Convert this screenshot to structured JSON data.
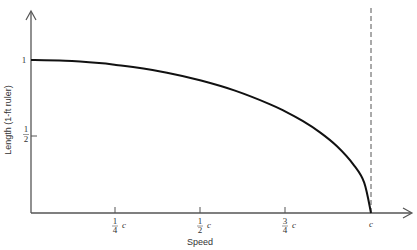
{
  "chart_data": {
    "type": "line",
    "title": "",
    "xlabel": "Speed",
    "ylabel": "Length (1-ft ruler)",
    "x_ticks": [
      {
        "num": "1",
        "den": "4",
        "unit": "c",
        "value": 0.25
      },
      {
        "num": "1",
        "den": "2",
        "unit": "c",
        "value": 0.5
      },
      {
        "num": "3",
        "den": "4",
        "unit": "c",
        "value": 0.75
      },
      {
        "num": "",
        "den": "",
        "unit": "c",
        "value": 1.0
      }
    ],
    "y_ticks": [
      {
        "label": "1",
        "value": 1.0
      },
      {
        "num": "1",
        "den": "2",
        "value": 0.5
      }
    ],
    "xlim": [
      0,
      1.0
    ],
    "ylim": [
      0,
      1.0
    ],
    "grid": false,
    "legend": null,
    "annotations": [
      "dashed vertical asymptote at speed = c"
    ],
    "series": [
      {
        "name": "Length vs speed",
        "x": [
          0,
          0.1,
          0.2,
          0.25,
          0.3,
          0.4,
          0.5,
          0.6,
          0.7,
          0.75,
          0.8,
          0.85,
          0.9,
          0.95,
          0.98,
          1.0
        ],
        "values": [
          1.0,
          0.995,
          0.98,
          0.968,
          0.954,
          0.917,
          0.866,
          0.8,
          0.714,
          0.661,
          0.6,
          0.527,
          0.436,
          0.312,
          0.199,
          0.0
        ]
      }
    ]
  }
}
